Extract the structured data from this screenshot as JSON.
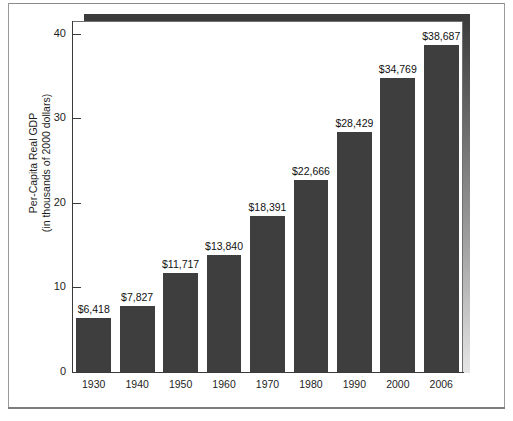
{
  "chart_data": {
    "type": "bar",
    "title": "",
    "xlabel": "",
    "ylabel": "Per-Capita Real GDP\n(in thousands of 2000 dollars)",
    "ylabel_line1": "Per-Capita Real GDP",
    "ylabel_line2": "(in thousands of 2000 dollars)",
    "categories": [
      "1930",
      "1940",
      "1950",
      "1960",
      "1970",
      "1980",
      "1990",
      "2000",
      "2006"
    ],
    "values": [
      6.418,
      7.827,
      11.717,
      13.84,
      18.391,
      22.666,
      28.429,
      34.769,
      38.687
    ],
    "point_labels": [
      "$6,418",
      "$7,827",
      "$11,717",
      "$13,840",
      "$18,391",
      "$22,666",
      "$28,429",
      "$34,769",
      "$38,687"
    ],
    "ylim": [
      0,
      41.5
    ],
    "yticks": [
      0,
      10,
      20,
      30,
      40
    ],
    "ytick_labels": [
      "0",
      "10",
      "20",
      "30",
      "40"
    ],
    "grid": false,
    "legend": null,
    "bar_color": "#3e3e3e",
    "background_color": "#ffffff",
    "axis_color": "#3a3a3a"
  }
}
